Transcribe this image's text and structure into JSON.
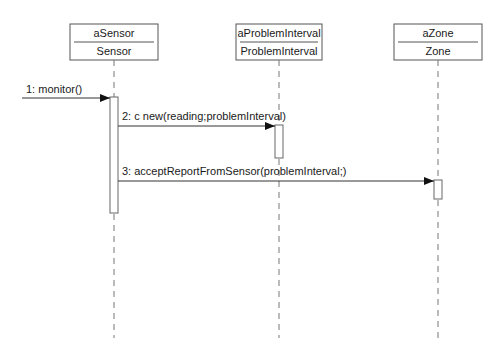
{
  "diagram": {
    "type": "sequence",
    "participants": [
      {
        "instance": "aSensor",
        "class": "Sensor",
        "x": 114
      },
      {
        "instance": "aProblemInterval",
        "class": "ProblemInterval",
        "x": 279
      },
      {
        "instance": "aZone",
        "class": "Zone",
        "x": 438
      }
    ],
    "messages": [
      {
        "label": "1: monitor()",
        "from": "external",
        "to": "aSensor"
      },
      {
        "label": "2: c new(reading;problemInterval)",
        "from": "aSensor",
        "to": "aProblemInterval"
      },
      {
        "label": "3: acceptReportFromSensor(problemInterval;)",
        "from": "aSensor",
        "to": "aZone"
      }
    ],
    "colors": {
      "line": "#555555",
      "text": "#1a1a1a",
      "background": "#ffffff"
    }
  }
}
